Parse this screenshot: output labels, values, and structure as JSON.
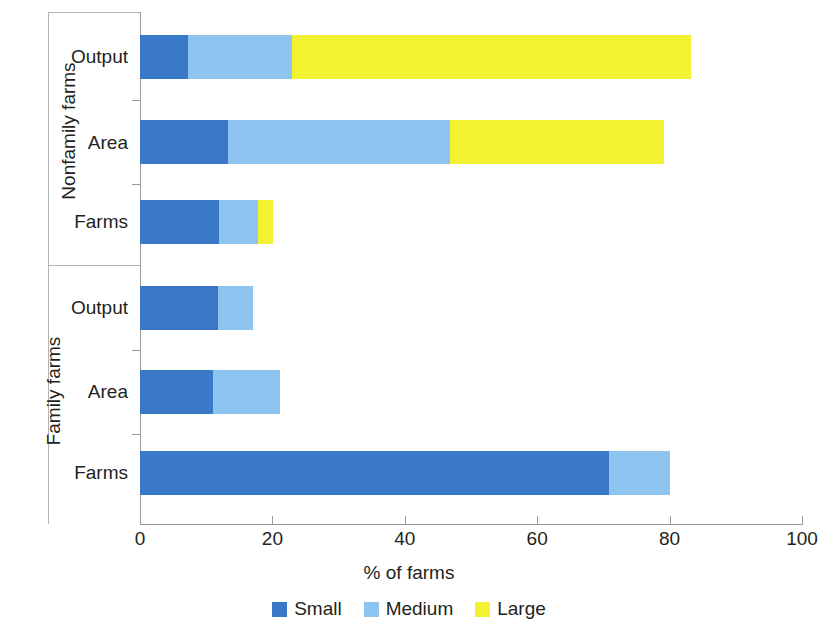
{
  "chart_data": {
    "type": "bar",
    "orientation": "horizontal",
    "stacked": true,
    "title": "",
    "xlabel": "% of farms",
    "ylabel": "",
    "xlim": [
      0,
      100
    ],
    "xticks": [
      0,
      20,
      40,
      60,
      80,
      100
    ],
    "xtick_labels": [
      "0",
      "20",
      "40",
      "60",
      "80",
      "100"
    ],
    "grid": false,
    "legend_position": "bottom-center",
    "series": [
      {
        "name": "Small",
        "color": "#3a78c8",
        "values": [
          70.9,
          11.0,
          11.8,
          11.9,
          13.3,
          7.2
        ]
      },
      {
        "name": "Medium",
        "color": "#8ec4f0",
        "values": [
          9.1,
          10.1,
          5.3,
          5.9,
          33.5,
          15.8
        ]
      },
      {
        "name": "Large",
        "color": "#f2f230",
        "values": [
          0.0,
          0.0,
          0.0,
          2.3,
          32.4,
          60.3
        ]
      }
    ],
    "categories": [
      "Farms",
      "Area",
      "Output",
      "Farms",
      "Area",
      "Output"
    ],
    "groups": [
      {
        "label": "Family farms",
        "categories": [
          "Farms",
          "Area",
          "Output"
        ]
      },
      {
        "label": "Nonfamily farms",
        "categories": [
          "Farms",
          "Area",
          "Output"
        ]
      }
    ],
    "totals": [
      80.0,
      21.1,
      17.1,
      20.1,
      79.2,
      83.3
    ]
  },
  "axis": {
    "x_title": "% of farms",
    "tick_labels": [
      "0",
      "20",
      "40",
      "60",
      "80",
      "100"
    ]
  },
  "groups": {
    "nonfamily": {
      "title": "Nonfamily farms",
      "rows": [
        {
          "label": "Output",
          "small": 7.2,
          "medium": 15.8,
          "large": 60.3
        },
        {
          "label": "Area",
          "small": 13.3,
          "medium": 33.5,
          "large": 32.4
        },
        {
          "label": "Farms",
          "small": 11.9,
          "medium": 5.9,
          "large": 2.3
        }
      ]
    },
    "family": {
      "title": "Family farms",
      "rows": [
        {
          "label": "Output",
          "small": 11.8,
          "medium": 5.3,
          "large": 0.0
        },
        {
          "label": "Area",
          "small": 11.0,
          "medium": 10.1,
          "large": 0.0
        },
        {
          "label": "Farms",
          "small": 70.9,
          "medium": 9.1,
          "large": 0.0
        }
      ]
    }
  },
  "legend": {
    "items": [
      {
        "label": "Small",
        "color": "#3a78c8",
        "swatch": "small-swatch"
      },
      {
        "label": "Medium",
        "color": "#8ec4f0",
        "swatch": "medium-swatch"
      },
      {
        "label": "Large",
        "color": "#f2f230",
        "swatch": "large-swatch"
      }
    ]
  },
  "colors": {
    "small": "#3a78c8",
    "medium": "#8ec4f0",
    "large": "#f2f230",
    "axis": "#9a9a9a",
    "text": "#231f20"
  }
}
